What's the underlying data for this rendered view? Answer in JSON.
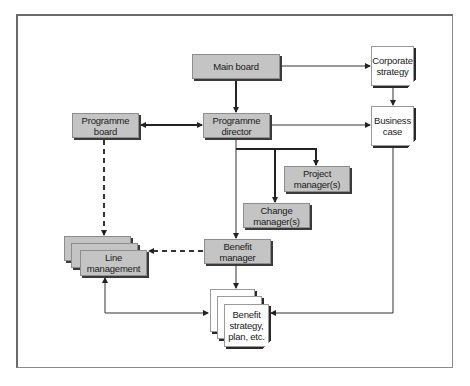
{
  "diagram": {
    "type": "organisation-flow",
    "nodes": {
      "main_board": {
        "label": "Main board",
        "style": "process"
      },
      "corporate_strategy": {
        "label": "Corporate strategy",
        "style": "document"
      },
      "programme_board": {
        "label": "Programme board",
        "style": "process"
      },
      "programme_director": {
        "label": "Programme director",
        "style": "process"
      },
      "business_case": {
        "label": "Business case",
        "style": "document"
      },
      "project_managers": {
        "label": "Project manager(s)",
        "style": "process"
      },
      "change_managers": {
        "label": "Change manager(s)",
        "style": "process"
      },
      "line_management": {
        "label": "Line management",
        "style": "process-stack"
      },
      "benefit_manager": {
        "label": "Benefit manager",
        "style": "process"
      },
      "benefit_strategy": {
        "label": "Benefit strategy, plan, etc.",
        "style": "document-stack"
      }
    },
    "edges": [
      {
        "from": "main_board",
        "to": "corporate_strategy",
        "line": "solid"
      },
      {
        "from": "main_board",
        "to": "programme_director",
        "line": "solid-bold"
      },
      {
        "from": "corporate_strategy",
        "to": "business_case",
        "line": "solid"
      },
      {
        "from": "programme_board",
        "to": "programme_director",
        "line": "solid-bold",
        "bidirectional": true
      },
      {
        "from": "programme_director",
        "to": "business_case",
        "line": "solid"
      },
      {
        "from": "programme_director",
        "to": "project_managers",
        "line": "solid-bold"
      },
      {
        "from": "programme_director",
        "to": "change_managers",
        "line": "solid-bold"
      },
      {
        "from": "programme_director",
        "to": "benefit_manager",
        "line": "solid"
      },
      {
        "from": "programme_board",
        "to": "line_management",
        "line": "dashed"
      },
      {
        "from": "benefit_manager",
        "to": "line_management",
        "line": "dashed"
      },
      {
        "from": "benefit_manager",
        "to": "benefit_strategy",
        "line": "solid"
      },
      {
        "from": "line_management",
        "to": "benefit_strategy",
        "line": "solid",
        "bidirectional": true
      },
      {
        "from": "business_case",
        "to": "benefit_strategy",
        "line": "solid"
      }
    ]
  },
  "colors": {
    "process_fill": "#c4c4c4",
    "document_fill": "#ffffff",
    "line": "#222222",
    "frame": "#6a6a6a"
  }
}
